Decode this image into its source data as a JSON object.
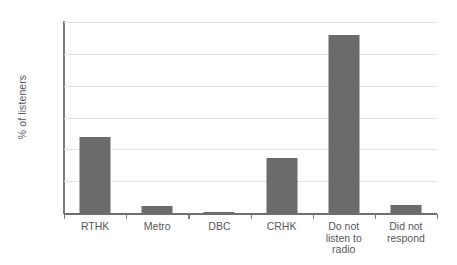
{
  "chart_data": {
    "type": "bar",
    "title": "",
    "xlabel": "",
    "ylabel": "% of listeners",
    "ylim": [
      0,
      60
    ],
    "yticks": [
      0,
      10,
      20,
      30,
      40,
      50,
      60
    ],
    "grid": true,
    "legend": null,
    "bar_color": "#6b6b6b",
    "categories": [
      "RTHK",
      "Metro",
      "DBC",
      "CRHK",
      "Do not\nlisten to\nradio",
      "Did not\nrespond"
    ],
    "values": [
      24,
      2.2,
      0.4,
      17.3,
      56,
      2.5
    ]
  },
  "axis": {
    "y_title": "% of listeners",
    "y_tick_labels": [
      "0",
      "10",
      "20",
      "30",
      "40",
      "50",
      "60"
    ]
  }
}
